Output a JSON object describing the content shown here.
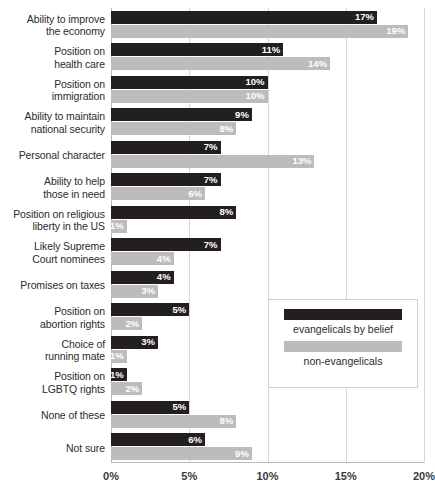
{
  "chart_data": {
    "type": "bar",
    "orientation": "horizontal",
    "grouped": true,
    "title": "",
    "subtitle": "",
    "xlabel": "",
    "ylabel": "",
    "xlim": [
      0,
      20
    ],
    "xticks": [
      0,
      5,
      10,
      15,
      20
    ],
    "xtick_labels": [
      "0%",
      "5%",
      "10%",
      "15%",
      "20%"
    ],
    "grid": true,
    "grid_axis": "x",
    "legend_position": "inside-right-lower",
    "value_label_suffix": "%",
    "categories": [
      "Ability to improve the economy",
      "Position on health care",
      "Position on immigration",
      "Ability to maintain national security",
      "Personal character",
      "Ability to help those in need",
      "Position on religious liberty in the US",
      "Likely Supreme Court nominees",
      "Promises on taxes",
      "Position on abortion rights",
      "Choice of running mate",
      "Position on LGBTQ rights",
      "None of these",
      "Not sure"
    ],
    "category_lines": [
      [
        "Ability to improve",
        "the economy"
      ],
      [
        "Position on",
        "health care"
      ],
      [
        "Position on",
        "immigration"
      ],
      [
        "Ability to maintain",
        "national security"
      ],
      [
        "Personal character"
      ],
      [
        "Ability to help",
        "those in need"
      ],
      [
        "Position on religious",
        "liberty in the US"
      ],
      [
        "Likely Supreme",
        "Court nominees"
      ],
      [
        "Promises on taxes"
      ],
      [
        "Position on",
        "abortion rights"
      ],
      [
        "Choice of",
        "running mate"
      ],
      [
        "Position on",
        "LGBTQ rights"
      ],
      [
        "None of these"
      ],
      [
        "Not sure"
      ]
    ],
    "series": [
      {
        "name": "evangelicals by belief",
        "color": "#231f20",
        "values": [
          17,
          11,
          10,
          9,
          7,
          7,
          8,
          7,
          4,
          5,
          3,
          1,
          5,
          6
        ],
        "labels": [
          "17%",
          "11%",
          "10%",
          "9%",
          "7%",
          "7%",
          "8%",
          "7%",
          "4%",
          "5%",
          "3%",
          "1%",
          "5%",
          "6%"
        ]
      },
      {
        "name": "non-evangelicals",
        "color": "#bcbcbc",
        "values": [
          19,
          14,
          10,
          8,
          13,
          6,
          1,
          4,
          3,
          2,
          1,
          2,
          8,
          9
        ],
        "labels": [
          "19%",
          "14%",
          "10%",
          "8%",
          "13%",
          "6%",
          "1%",
          "4%",
          "3%",
          "2%",
          "1%",
          "2%",
          "8%",
          "9%"
        ]
      }
    ]
  },
  "legend": {
    "items": [
      {
        "label": "evangelicals by belief",
        "color": "#231f20"
      },
      {
        "label": "non-evangelicals",
        "color": "#bcbcbc"
      }
    ]
  },
  "colors": {
    "series_dark": "#231f20",
    "series_light": "#bcbcbc",
    "gridline": "#d6d6d6",
    "axis": "#b9b9b9",
    "text": "#2b2b2b",
    "background": "#ffffff"
  }
}
